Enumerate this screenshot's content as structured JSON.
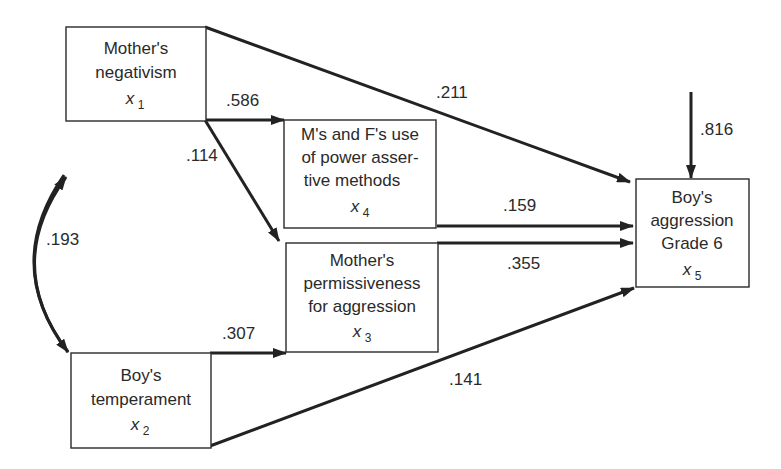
{
  "diagram": {
    "type": "path-diagram",
    "nodes": [
      {
        "id": "x1",
        "lines": [
          "Mother's",
          "negativism"
        ],
        "var": "x",
        "sub": "1"
      },
      {
        "id": "x2",
        "lines": [
          "Boy's",
          "temperament"
        ],
        "var": "x",
        "sub": "2"
      },
      {
        "id": "x3",
        "lines": [
          "Mother's",
          "permissiveness",
          "for aggression"
        ],
        "var": "x",
        "sub": "3"
      },
      {
        "id": "x4",
        "lines": [
          "M's and F's use",
          "of power asser-",
          "tive methods"
        ],
        "var": "x",
        "sub": "4"
      },
      {
        "id": "x5",
        "lines": [
          "Boy's",
          "aggression",
          "Grade 6"
        ],
        "var": "x",
        "sub": "5"
      }
    ],
    "edges": [
      {
        "from": "x1",
        "to": "x4",
        "coef": ".586"
      },
      {
        "from": "x1",
        "to": "x3",
        "coef": ".114"
      },
      {
        "from": "x1",
        "to": "x5",
        "coef": ".211"
      },
      {
        "from": "x4",
        "to": "x5",
        "coef": ".159"
      },
      {
        "from": "x3",
        "to": "x5",
        "coef": ".355"
      },
      {
        "from": "x2",
        "to": "x3",
        "coef": ".307"
      },
      {
        "from": "x2",
        "to": "x5",
        "coef": ".141"
      },
      {
        "from": "x1",
        "to": "x2",
        "coef": ".193",
        "kind": "correlation"
      },
      {
        "from": "residual",
        "to": "x5",
        "coef": ".816",
        "kind": "residual"
      }
    ]
  }
}
